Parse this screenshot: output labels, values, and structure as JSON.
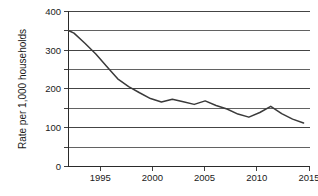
{
  "chart_data": {
    "type": "line",
    "title": "",
    "xlabel": "",
    "ylabel": "Rate per 1,000 households",
    "xlim": [
      1993.5,
      2015.5
    ],
    "ylim": [
      0,
      400
    ],
    "grid": true,
    "legend": "none",
    "x_tick_labels": [
      "1995",
      "2000",
      "2005",
      "2010",
      "2015"
    ],
    "x_ticks": [
      1995,
      2000,
      2005,
      2010,
      2015
    ],
    "y_tick_labels": [
      "0",
      "100",
      "200",
      "300",
      "400"
    ],
    "y_ticks": [
      0,
      100,
      200,
      300,
      400
    ],
    "y_gridlines_minor": [
      50,
      150,
      250,
      350
    ],
    "series": [
      {
        "name": "Property crime rate",
        "x": [
          1993.5,
          1994,
          1995,
          1996,
          1997,
          1998,
          1999,
          2000,
          2001,
          2002,
          2003,
          2004,
          2005,
          2006,
          2007,
          2008,
          2009,
          2010,
          2011,
          2012,
          2013,
          2014,
          2015
        ],
        "values": [
          351,
          344,
          318,
          290,
          258,
          226,
          206,
          190,
          175,
          166,
          173,
          167,
          160,
          169,
          157,
          148,
          135,
          127,
          139,
          155,
          136,
          122,
          112
        ]
      }
    ]
  }
}
